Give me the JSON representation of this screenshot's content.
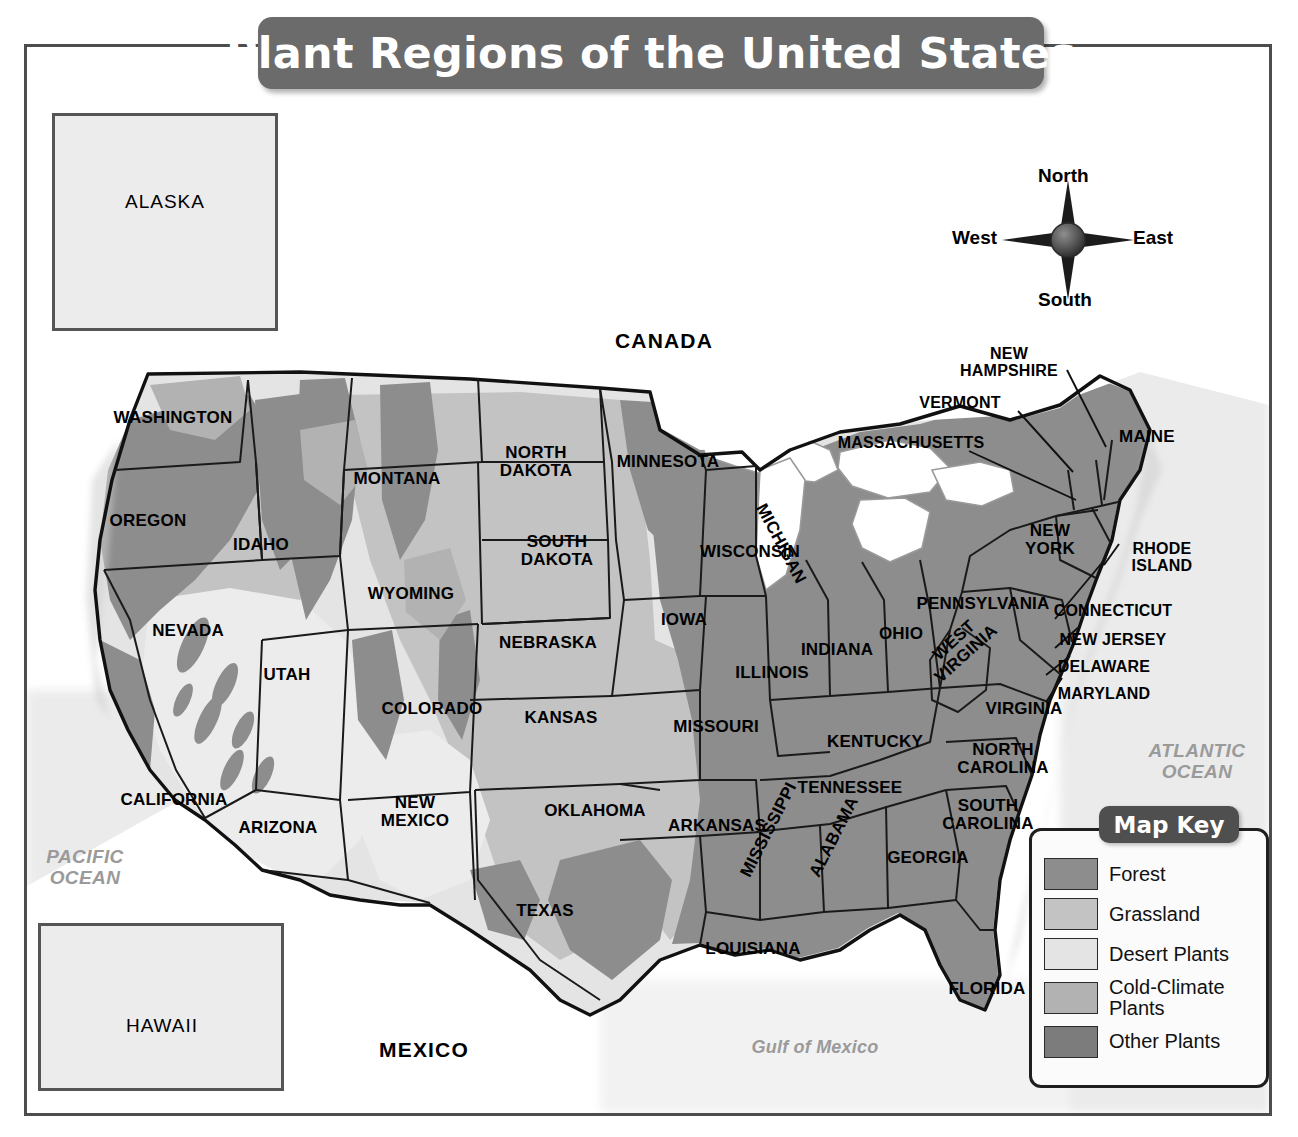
{
  "title": "Plant Regions of the United States",
  "compass": {
    "north": "North",
    "south": "South",
    "east": "East",
    "west": "West",
    "icon": "compass-rose-icon"
  },
  "map_key": {
    "heading": "Map Key",
    "entries": [
      {
        "label": "Forest",
        "color": "#8d8d8d"
      },
      {
        "label": "Grassland",
        "color": "#c3c3c3"
      },
      {
        "label": "Desert Plants",
        "color": "#e4e4e4"
      },
      {
        "label": "Cold-Climate\nPlants",
        "color": "#b2b2b2"
      },
      {
        "label": "Other Plants",
        "color": "#7c7c7c"
      }
    ]
  },
  "insets": [
    {
      "name": "alaska",
      "label": "ALASKA"
    },
    {
      "name": "hawaii",
      "label": "HAWAII"
    }
  ],
  "countries": [
    {
      "label": "CANADA",
      "x": 664,
      "y": 341
    },
    {
      "label": "MEXICO",
      "x": 424,
      "y": 1050
    }
  ],
  "water_labels": [
    {
      "label": "PACIFIC\nOCEAN",
      "x": 85,
      "y": 868,
      "style": "ocean"
    },
    {
      "label": "ATLANTIC\nOCEAN",
      "x": 1197,
      "y": 762,
      "style": "ocean"
    },
    {
      "label": "Gulf of Mexico",
      "x": 815,
      "y": 1048,
      "style": "gulf"
    }
  ],
  "states": [
    {
      "label": "WASHINGTON",
      "x": 173,
      "y": 418,
      "rot": 0
    },
    {
      "label": "OREGON",
      "x": 148,
      "y": 521,
      "rot": 0
    },
    {
      "label": "IDAHO",
      "x": 261,
      "y": 545,
      "rot": 0
    },
    {
      "label": "MONTANA",
      "x": 397,
      "y": 479,
      "rot": 0
    },
    {
      "label": "WYOMING",
      "x": 411,
      "y": 594,
      "rot": 0
    },
    {
      "label": "NEVADA",
      "x": 188,
      "y": 631,
      "rot": 0
    },
    {
      "label": "UTAH",
      "x": 287,
      "y": 675,
      "rot": 0
    },
    {
      "label": "CALIFORNIA",
      "x": 174,
      "y": 800,
      "rot": 0
    },
    {
      "label": "ARIZONA",
      "x": 278,
      "y": 828,
      "rot": 0
    },
    {
      "label": "NEW\nMEXICO",
      "x": 415,
      "y": 812,
      "rot": 0
    },
    {
      "label": "COLORADO",
      "x": 432,
      "y": 709,
      "rot": 0
    },
    {
      "label": "NORTH\nDAKOTA",
      "x": 536,
      "y": 462,
      "rot": 0
    },
    {
      "label": "SOUTH\nDAKOTA",
      "x": 557,
      "y": 551,
      "rot": 0
    },
    {
      "label": "NEBRASKA",
      "x": 548,
      "y": 643,
      "rot": 0
    },
    {
      "label": "KANSAS",
      "x": 561,
      "y": 718,
      "rot": 0
    },
    {
      "label": "OKLAHOMA",
      "x": 595,
      "y": 811,
      "rot": 0
    },
    {
      "label": "TEXAS",
      "x": 545,
      "y": 911,
      "rot": 0
    },
    {
      "label": "MINNESOTA",
      "x": 668,
      "y": 462,
      "rot": 0
    },
    {
      "label": "IOWA",
      "x": 684,
      "y": 620,
      "rot": 0
    },
    {
      "label": "MISSOURI",
      "x": 716,
      "y": 727,
      "rot": 0
    },
    {
      "label": "ARKANSAS",
      "x": 717,
      "y": 826,
      "rot": 0
    },
    {
      "label": "LOUISIANA",
      "x": 753,
      "y": 949,
      "rot": 0
    },
    {
      "label": "WISCONSIN",
      "x": 750,
      "y": 552,
      "rot": 0
    },
    {
      "label": "ILLINOIS",
      "x": 772,
      "y": 673,
      "rot": 0
    },
    {
      "label": "INDIANA",
      "x": 837,
      "y": 650,
      "rot": 0
    },
    {
      "label": "OHIO",
      "x": 901,
      "y": 634,
      "rot": 0
    },
    {
      "label": "MICHIGAN",
      "x": 812,
      "y": 510,
      "rot": 62
    },
    {
      "label": "KENTUCKY",
      "x": 875,
      "y": 742,
      "rot": 0
    },
    {
      "label": "TENNESSEE",
      "x": 850,
      "y": 788,
      "rot": 0
    },
    {
      "label": "MISSISSIPPI",
      "x": 789,
      "y": 881,
      "rot": -63
    },
    {
      "label": "ALABAMA",
      "x": 850,
      "y": 881,
      "rot": -63
    },
    {
      "label": "GEORGIA",
      "x": 928,
      "y": 858,
      "rot": 0
    },
    {
      "label": "FLORIDA",
      "x": 987,
      "y": 989,
      "rot": 0
    },
    {
      "label": "SOUTH\nCAROLINA",
      "x": 988,
      "y": 815,
      "rot": 0
    },
    {
      "label": "NORTH\nCAROLINA",
      "x": 1003,
      "y": 759,
      "rot": 0
    },
    {
      "label": "VIRGINIA",
      "x": 1024,
      "y": 709,
      "rot": 0
    },
    {
      "label": "WEST\nVIRGINIA",
      "x": 958,
      "y": 678,
      "rot": -42
    },
    {
      "label": "PENNSYLVANIA",
      "x": 983,
      "y": 604,
      "rot": 0
    },
    {
      "label": "NEW\nYORK",
      "x": 1050,
      "y": 540,
      "rot": 0
    },
    {
      "label": "MAINE",
      "x": 1147,
      "y": 437,
      "rot": 0
    }
  ],
  "callout_states": [
    {
      "label": "NEW\nHAMPSHIRE",
      "tx": 1009,
      "ty": 362,
      "lx": 1106,
      "ly": 447
    },
    {
      "label": "VERMONT",
      "tx": 960,
      "ty": 403,
      "lx": 1073,
      "ly": 472
    },
    {
      "label": "MASSACHUSETTS",
      "tx": 911,
      "ty": 443,
      "lx": 1076,
      "ly": 500
    },
    {
      "label": "RHODE\nISLAND",
      "tx": 1162,
      "ty": 557,
      "lx": 1119,
      "ly": 544
    },
    {
      "label": "CONNECTICUT",
      "tx": 1113,
      "ty": 611,
      "lx": 1106,
      "ly": 558
    },
    {
      "label": "NEW JERSEY",
      "tx": 1113,
      "ty": 640,
      "lx": 1080,
      "ly": 626
    },
    {
      "label": "DELAWARE",
      "tx": 1104,
      "ty": 667,
      "lx": 1070,
      "ly": 656
    },
    {
      "label": "MARYLAND",
      "tx": 1104,
      "ty": 694,
      "lx": 1062,
      "ly": 678
    }
  ]
}
